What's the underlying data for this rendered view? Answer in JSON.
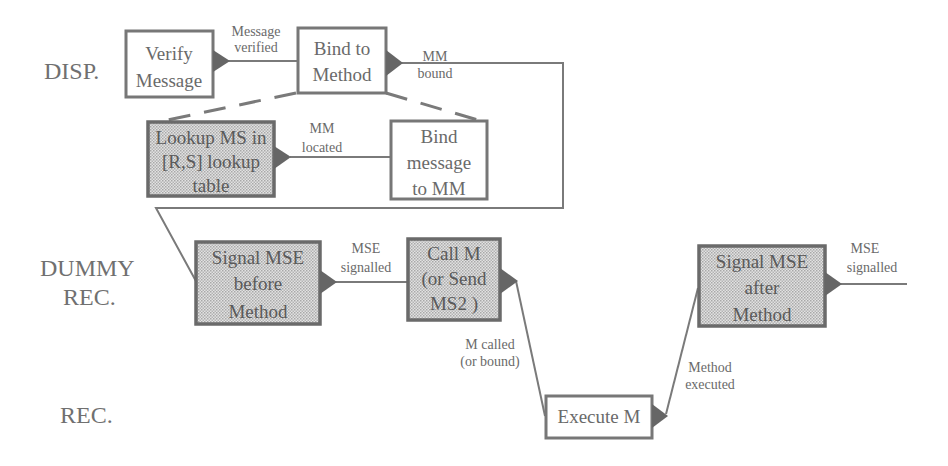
{
  "diagram": {
    "swimlanes": [
      {
        "id": "disp",
        "label": "DISP."
      },
      {
        "id": "dummy",
        "label_line1": "DUMMY",
        "label_line2": "REC."
      },
      {
        "id": "rec",
        "label": "REC."
      }
    ],
    "nodes": {
      "verify_message": {
        "lines": [
          "Verify",
          "Message"
        ],
        "lane": "disp",
        "shaded": false
      },
      "bind_to_method": {
        "lines": [
          "Bind to",
          "Method"
        ],
        "lane": "disp",
        "shaded": false
      },
      "lookup_ms": {
        "lines": [
          "Lookup MS in",
          "[R,S] lookup",
          "table"
        ],
        "lane": "disp",
        "shaded": true
      },
      "bind_message": {
        "lines": [
          "Bind",
          "message",
          "to MM"
        ],
        "lane": "disp",
        "shaded": false
      },
      "signal_before": {
        "lines": [
          "Signal MSE",
          "before",
          "Method"
        ],
        "lane": "dummy",
        "shaded": true
      },
      "call_m": {
        "lines": [
          "Call M",
          "(or Send",
          "MS2 )"
        ],
        "lane": "dummy",
        "shaded": true
      },
      "execute_m": {
        "lines": [
          "Execute M"
        ],
        "lane": "rec",
        "shaded": false
      },
      "signal_after": {
        "lines": [
          "Signal MSE",
          "after",
          "Method"
        ],
        "lane": "dummy",
        "shaded": true
      }
    },
    "edges": {
      "message_verified": {
        "line1": "Message",
        "line2": "verified"
      },
      "mm_bound": {
        "line1": "MM",
        "line2": "bound"
      },
      "mm_located": {
        "line1": "MM",
        "line2": "located"
      },
      "mse_signalled_1": {
        "line1": "MSE",
        "line2": "signalled"
      },
      "m_called": {
        "line1": "M called",
        "line2": "(or bound)"
      },
      "method_executed": {
        "line1": "Method",
        "line2": "executed"
      },
      "mse_signalled_2": {
        "line1": "MSE",
        "line2": "signalled"
      }
    }
  }
}
